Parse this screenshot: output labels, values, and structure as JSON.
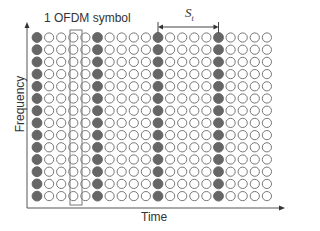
{
  "labels": {
    "symbol": "1 OFDM symbol",
    "x_axis": "Time",
    "y_axis": "Frequency",
    "spacing_main": "S",
    "spacing_sub": "t"
  },
  "grid": {
    "rows": 14,
    "cols": 20,
    "pilot_every": 5,
    "pilot_cols": [
      0,
      5,
      10,
      15
    ],
    "highlight_col": 3,
    "spacing_arrow_cols": [
      10,
      15
    ]
  },
  "colors": {
    "pilot_fill": "#666666",
    "data_stroke": "#777777",
    "axis": "#555555",
    "box": "#777777"
  }
}
